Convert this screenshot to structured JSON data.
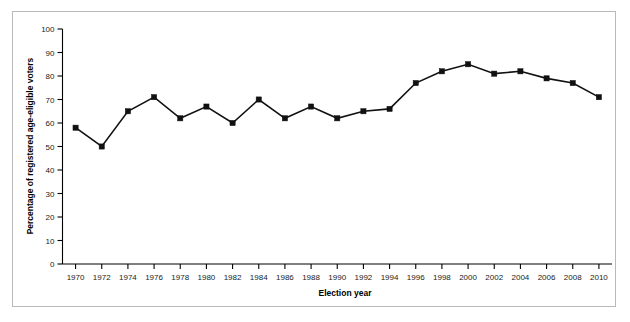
{
  "figure": {
    "background_color": "#ffffff",
    "frame_color": "#b9b9b9",
    "line_color": "#111111",
    "marker_color": "#111111",
    "axis_color": "#000000"
  },
  "chart_data": {
    "type": "line",
    "title": "",
    "subtitle": "",
    "xlabel": "Election year",
    "ylabel": "Percentage of registered age-eligible voters",
    "xlim": [
      1969,
      2011
    ],
    "ylim": [
      0,
      100
    ],
    "ytick_step": 10,
    "xtick_step": 2,
    "grid": false,
    "legend": null,
    "marker": "square",
    "x": [
      1970,
      1972,
      1974,
      1976,
      1978,
      1980,
      1982,
      1984,
      1986,
      1988,
      1990,
      1992,
      1994,
      1996,
      1998,
      2000,
      2002,
      2004,
      2006,
      2008,
      2010
    ],
    "values": [
      58,
      50,
      65,
      71,
      62,
      67,
      60,
      70,
      62,
      67,
      62,
      65,
      66,
      77,
      82,
      85,
      81,
      82,
      79,
      77,
      71
    ],
    "categories": [
      "1970",
      "1972",
      "1974",
      "1976",
      "1978",
      "1980",
      "1982",
      "1984",
      "1986",
      "1988",
      "1990",
      "1992",
      "1994",
      "1996",
      "1998",
      "2000",
      "2002",
      "2004",
      "2006",
      "2008",
      "2010"
    ],
    "ytick_labels": [
      "0",
      "10",
      "20",
      "30",
      "40",
      "50",
      "60",
      "70",
      "80",
      "90",
      "100"
    ],
    "ytick_values": [
      0,
      10,
      20,
      30,
      40,
      50,
      60,
      70,
      80,
      90,
      100
    ],
    "xtick_labels": [
      "1970",
      "1972",
      "1974",
      "1976",
      "1978",
      "1980",
      "1982",
      "1984",
      "1986",
      "1988",
      "1990",
      "1992",
      "1994",
      "1996",
      "1998",
      "2000",
      "2002",
      "2004",
      "2006",
      "2008",
      "2010"
    ]
  }
}
